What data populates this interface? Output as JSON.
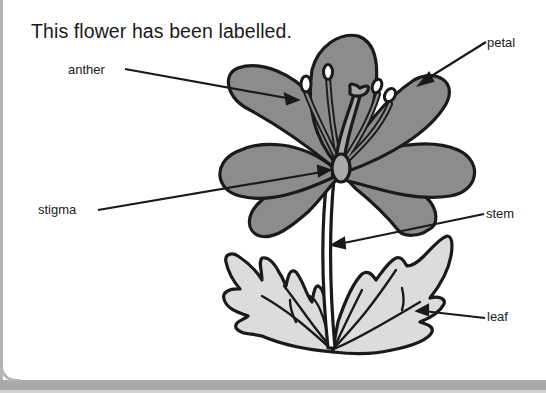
{
  "title": "This flower has been labelled.",
  "labels": {
    "anther": "anther",
    "petal": "petal",
    "stigma": "stigma",
    "stem": "stem",
    "leaf": "leaf"
  },
  "colors": {
    "petal_fill": "#8c8c8c",
    "leaf_fill": "#dcdcdc",
    "outline": "#1a1a1a",
    "frame": "#a9a9a9"
  }
}
